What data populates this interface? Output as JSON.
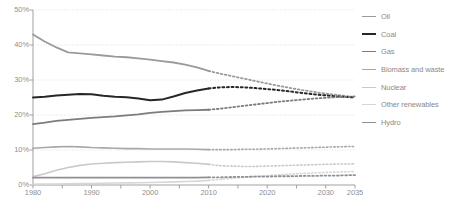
{
  "chart_data": {
    "type": "line",
    "title": "",
    "subtitle": "",
    "xlabel": "",
    "ylabel": "",
    "xlim": [
      1980,
      2035
    ],
    "ylim": [
      0,
      50
    ],
    "grid": true,
    "grid_axis": "y",
    "legend_position": "right",
    "value_unit": "%",
    "x_ticks": [
      1980,
      1990,
      2000,
      2010,
      2020,
      2030,
      2035
    ],
    "x_tick_labels": [
      "1980",
      "1990",
      "2000",
      "2010",
      "2020",
      "2030",
      "2035"
    ],
    "x_minor_ticks": [
      1985,
      1995,
      2005,
      2015,
      2025
    ],
    "y_ticks": [
      0,
      10,
      20,
      30,
      40,
      50
    ],
    "y_tick_labels": [
      "0%",
      "10%",
      "20%",
      "30%",
      "40%",
      "50%"
    ],
    "history_end": 2010,
    "history_style": "solid",
    "forecast_style": "dotted",
    "x": [
      1980,
      1982,
      1984,
      1986,
      1988,
      1990,
      1992,
      1994,
      1996,
      1998,
      2000,
      2002,
      2004,
      2006,
      2008,
      2010,
      2012,
      2014,
      2016,
      2018,
      2020,
      2022,
      2024,
      2026,
      2028,
      2030,
      2032,
      2034,
      2035
    ],
    "series": [
      {
        "name": "Oil",
        "color": "#9a9a9a",
        "width": 1.8,
        "values": [
          43.0,
          41.0,
          39.3,
          37.9,
          37.6,
          37.3,
          37.0,
          36.7,
          36.5,
          36.2,
          35.8,
          35.4,
          35.0,
          34.4,
          33.6,
          32.6,
          31.8,
          31.1,
          30.4,
          29.7,
          29.0,
          28.3,
          27.7,
          27.1,
          26.6,
          26.1,
          25.7,
          25.3,
          25.1
        ]
      },
      {
        "name": "Coal",
        "color": "#272727",
        "width": 2.0,
        "values": [
          25.0,
          25.2,
          25.6,
          25.8,
          26.0,
          25.9,
          25.5,
          25.2,
          25.1,
          24.7,
          24.2,
          24.4,
          25.3,
          26.3,
          27.0,
          27.6,
          27.9,
          28.0,
          27.9,
          27.7,
          27.4,
          27.1,
          26.7,
          26.3,
          25.9,
          25.6,
          25.3,
          25.1,
          25.0
        ]
      },
      {
        "name": "Gas",
        "color": "#7c7c7c",
        "width": 1.8,
        "values": [
          17.4,
          17.8,
          18.3,
          18.6,
          18.9,
          19.2,
          19.4,
          19.6,
          19.9,
          20.2,
          20.6,
          20.9,
          21.1,
          21.3,
          21.4,
          21.5,
          21.8,
          22.2,
          22.6,
          23.0,
          23.4,
          23.8,
          24.1,
          24.4,
          24.7,
          24.9,
          25.1,
          25.2,
          25.3
        ]
      },
      {
        "name": "Biomass and waste",
        "color": "#a8a8a8",
        "width": 1.6,
        "values": [
          10.5,
          10.7,
          10.9,
          11.0,
          10.9,
          10.7,
          10.6,
          10.5,
          10.4,
          10.4,
          10.3,
          10.3,
          10.3,
          10.3,
          10.2,
          10.1,
          10.1,
          10.1,
          10.2,
          10.2,
          10.3,
          10.4,
          10.5,
          10.6,
          10.7,
          10.8,
          10.9,
          11.0,
          11.0
        ]
      },
      {
        "name": "Nuclear",
        "color": "#c9c9c9",
        "width": 1.6,
        "values": [
          2.4,
          3.2,
          4.2,
          5.0,
          5.6,
          6.0,
          6.2,
          6.4,
          6.5,
          6.6,
          6.7,
          6.7,
          6.6,
          6.4,
          6.2,
          5.9,
          5.5,
          5.4,
          5.3,
          5.3,
          5.4,
          5.5,
          5.6,
          5.7,
          5.8,
          5.9,
          6.0,
          6.0,
          6.1
        ]
      },
      {
        "name": "Other renewables",
        "color": "#d6d6d6",
        "width": 1.6,
        "values": [
          0.2,
          0.25,
          0.3,
          0.35,
          0.4,
          0.45,
          0.5,
          0.55,
          0.6,
          0.65,
          0.7,
          0.8,
          0.9,
          1.0,
          1.1,
          1.3,
          1.6,
          1.9,
          2.2,
          2.5,
          2.7,
          2.9,
          3.1,
          3.3,
          3.4,
          3.6,
          3.7,
          3.8,
          3.9
        ]
      },
      {
        "name": "Hydro",
        "color": "#909090",
        "width": 1.8,
        "values": [
          2.1,
          2.1,
          2.1,
          2.1,
          2.1,
          2.1,
          2.1,
          2.1,
          2.1,
          2.1,
          2.1,
          2.1,
          2.1,
          2.1,
          2.1,
          2.2,
          2.2,
          2.3,
          2.3,
          2.4,
          2.4,
          2.5,
          2.5,
          2.6,
          2.6,
          2.7,
          2.7,
          2.8,
          2.8
        ]
      }
    ]
  },
  "legend": {
    "items": [
      {
        "label": "Oil",
        "color": "#9a9a9a",
        "width": 1.8
      },
      {
        "label": "Coal",
        "color": "#272727",
        "width": 2.2
      },
      {
        "label": "Gas",
        "color": "#7c7c7c",
        "width": 1.8
      },
      {
        "label": "Biomass and waste",
        "color": "#a8a8a8",
        "width": 1.6
      },
      {
        "label": "Nuclear",
        "color": "#c9c9c9",
        "width": 1.6
      },
      {
        "label": "Other renewables",
        "color": "#d6d6d6",
        "width": 1.6
      },
      {
        "label": "Hydro",
        "color": "#909090",
        "width": 1.8
      }
    ]
  },
  "axis": {
    "line_color": "#a0a0a0",
    "grid_color": "#d9d9d9",
    "label_color": "#8f8f8f"
  }
}
